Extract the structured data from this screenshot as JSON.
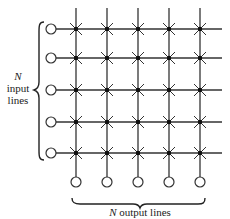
{
  "diagram": {
    "rows": 5,
    "cols": 5,
    "input_label": {
      "symbol": "N",
      "line1": "input",
      "line2": "lines"
    },
    "output_label": {
      "symbol": "N",
      "text": "output lines"
    },
    "crosspoint_symbol": "asterisk-with-dot",
    "terminal_symbol": "open-circle"
  }
}
